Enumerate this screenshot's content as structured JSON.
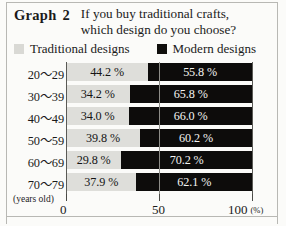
{
  "header": {
    "graph_label": "Graph",
    "graph_number": "2",
    "question_line1": "If you buy traditional crafts,",
    "question_line2": "which design do you choose?"
  },
  "legend": {
    "traditional": {
      "label": "Traditional designs",
      "swatch_icon": "legend-swatch-light",
      "color": "#d9d9d5"
    },
    "modern": {
      "label": "Modern designs",
      "swatch_icon": "legend-swatch-dark",
      "color": "#100f0d"
    }
  },
  "axis": {
    "unit_note": "(years old)",
    "ticks": [
      "0",
      "50",
      "100"
    ],
    "unit": "(%)"
  },
  "chart_data": {
    "type": "bar",
    "orientation": "horizontal",
    "stacked": true,
    "title": "Graph 2  If you buy traditional crafts, which design do you choose?",
    "xlabel": "(%)",
    "ylabel": "(years old)",
    "xlim": [
      0,
      100
    ],
    "xticks": [
      0,
      50,
      100
    ],
    "grid": false,
    "legend_position": "top",
    "categories": [
      "20～29",
      "30～39",
      "40～49",
      "50～59",
      "60～69",
      "70～79"
    ],
    "series": [
      {
        "name": "Traditional designs",
        "color": "#dededa",
        "values": [
          44.2,
          34.2,
          34.0,
          39.8,
          29.8,
          37.9
        ],
        "labels": [
          "44.2 %",
          "34.2 %",
          "34.0 %",
          "39.8 %",
          "29.8 %",
          "37.9 %"
        ]
      },
      {
        "name": "Modern designs",
        "color": "#0d0c0b",
        "values": [
          55.8,
          65.8,
          66.0,
          60.2,
          70.2,
          62.1
        ],
        "labels": [
          "55.8 %",
          "65.8 %",
          "66.0 %",
          "60.2 %",
          "70.2 %",
          "62.1 %"
        ]
      }
    ],
    "rows": [
      {
        "category": "20～29",
        "traditional": "44.2 %",
        "modern": "55.8 %",
        "t": 44.2,
        "m": 55.8
      },
      {
        "category": "30～39",
        "traditional": "34.2 %",
        "modern": "65.8 %",
        "t": 34.2,
        "m": 65.8
      },
      {
        "category": "40～49",
        "traditional": "34.0 %",
        "modern": "66.0 %",
        "t": 34.0,
        "m": 66.0
      },
      {
        "category": "50～59",
        "traditional": "39.8 %",
        "modern": "60.2 %",
        "t": 39.8,
        "m": 60.2
      },
      {
        "category": "60～69",
        "traditional": "29.8 %",
        "modern": "70.2 %",
        "t": 29.8,
        "m": 70.2
      },
      {
        "category": "70～79",
        "traditional": "37.9 %",
        "modern": "62.1 %",
        "t": 37.9,
        "m": 62.1
      }
    ]
  }
}
